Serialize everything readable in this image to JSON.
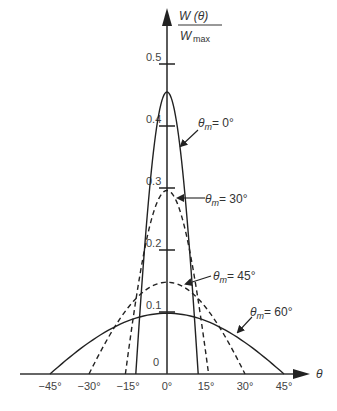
{
  "chart_data": {
    "type": "line",
    "title": "",
    "xlabel": "θ",
    "ylabel": "W(θ) / W_max",
    "xlim": [
      -45,
      45
    ],
    "ylim": [
      0,
      0.5
    ],
    "grid": false,
    "x_ticks": [
      "-45°",
      "-30°",
      "-15°",
      "0°",
      "15°",
      "30°",
      "45°"
    ],
    "x_tick_values": [
      -45,
      -30,
      -15,
      0,
      15,
      30,
      45
    ],
    "y_ticks": [
      "0",
      "0.1",
      "0.2",
      "0.3",
      "0.4",
      "0.5"
    ],
    "y_tick_values": [
      0,
      0.1,
      0.2,
      0.3,
      0.4,
      0.5
    ],
    "series": [
      {
        "name": "θm = 0°",
        "style": "solid",
        "peak": 0.455,
        "half_width_deg": 12,
        "x": [
          -12,
          -9,
          -6,
          -3,
          0,
          3,
          6,
          9,
          12
        ],
        "values": [
          0,
          0.2,
          0.34,
          0.425,
          0.455,
          0.425,
          0.34,
          0.2,
          0
        ]
      },
      {
        "name": "θm = 30°",
        "style": "dashed",
        "peak": 0.296,
        "half_width_deg": 16,
        "x": [
          -16,
          -12,
          -8,
          -4,
          0,
          4,
          8,
          12,
          16
        ],
        "values": [
          0,
          0.13,
          0.222,
          0.278,
          0.296,
          0.278,
          0.222,
          0.13,
          0
        ]
      },
      {
        "name": "θm = 45°",
        "style": "dashed",
        "peak": 0.148,
        "half_width_deg": 30,
        "x": [
          -30,
          -20,
          -10,
          0,
          10,
          20,
          30
        ],
        "values": [
          0,
          0.082,
          0.132,
          0.148,
          0.132,
          0.082,
          0
        ]
      },
      {
        "name": "θm = 60°",
        "style": "solid",
        "peak": 0.098,
        "half_width_deg": 45,
        "x": [
          -45,
          -30,
          -15,
          0,
          15,
          30,
          45
        ],
        "values": [
          0,
          0.054,
          0.087,
          0.098,
          0.087,
          0.054,
          0
        ]
      }
    ],
    "annotations": [
      {
        "text": "θm = 0°",
        "points_to_series": 0
      },
      {
        "text": "θm = 30°",
        "points_to_series": 1
      },
      {
        "text": "θm = 45°",
        "points_to_series": 2
      },
      {
        "text": "θm = 60°",
        "points_to_series": 3
      }
    ]
  },
  "labels": {
    "y_axis_numerator": "W (θ)",
    "y_axis_denominator_main": "W",
    "y_axis_denominator_sub": "max",
    "x_axis": "θ",
    "ann_theta": "θ",
    "ann_sub": "m",
    "ann0": "= 0°",
    "ann30": "= 30°",
    "ann45": "= 45°",
    "ann60": "= 60°"
  }
}
